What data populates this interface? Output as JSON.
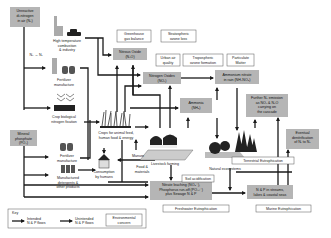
{
  "sources": {
    "unreactive_n2": [
      "Unreactive",
      "di-nitrogen",
      "in air (N₂)"
    ],
    "mineral_phosphate": [
      "Mineral",
      "phosphate",
      "(PO₄)"
    ],
    "n2_to_nr_label": "N₂ → Nᵣ"
  },
  "processes": {
    "combustion": [
      "High temperature",
      "combustion",
      "& industry"
    ],
    "fertilizer_n": [
      "Fertilizer",
      "manufacture"
    ],
    "bnf": [
      "Crop biological",
      "nitrogen fixation"
    ],
    "fertilizer_p": [
      "Fertilizer",
      "manufacture"
    ],
    "detergents": [
      "Manufactured",
      "detergents &",
      "other products"
    ],
    "crops": [
      "Crops for animal feed,",
      "human food & energy"
    ],
    "consumption": [
      "Consumption",
      "by humans"
    ],
    "livestock": "Livestock farming",
    "manure": "Manure",
    "food_materials": [
      "Food &",
      "materials"
    ],
    "natural_ecosystems": "Natural ecosystems"
  },
  "compounds": {
    "nitrous_oxide": [
      "Nitrous Oxide",
      "(N₂O)"
    ],
    "nitrogen_oxides": [
      "Nitrogen Oxides",
      "(NOₓ)"
    ],
    "ammonium_nitrate": [
      "Ammonium nitrate",
      "in rain (NH₄NO₃)"
    ],
    "ammonia": [
      "Ammonia",
      "(NH₃)"
    ],
    "further_emission": [
      "Further N₂ emission",
      "as NOₓ & N₂O",
      "carrying on",
      "the cascade"
    ],
    "denitrification": [
      "Eventual",
      "denitrification",
      "of Nᵣ to N₂"
    ],
    "leaching": [
      "Nitrate leaching (NO₃⁻),",
      "Phosphorus run-off (PO₄³⁻)",
      "plus Sewage N & P"
    ],
    "streams": [
      "N & P in streams,",
      "lakes & coastal seas"
    ]
  },
  "concerns": {
    "greenhouse": [
      "Greenhouse",
      "gas balance"
    ],
    "ozone_loss": [
      "Stratospheric",
      "ozone loss"
    ],
    "urban_air": [
      "Urban air",
      "quality"
    ],
    "tropospheric": [
      "Tropospheric",
      "ozone formation"
    ],
    "particulate": [
      "Particulate",
      "Matter"
    ],
    "terrestrial_eutro": "Terrestrial Eutrophication",
    "soil_acid": "Soil acidification",
    "freshwater_eutro": "Freshwater Eutrophication",
    "marine_eutro": "Marine Eutrophication"
  },
  "key": {
    "title": "Key",
    "intended": [
      "Intended",
      "N & P flows"
    ],
    "unintended": [
      "Unintended",
      "N & P flows"
    ],
    "concern": [
      "Environmental",
      "concern"
    ]
  },
  "colors": {
    "compound_box": "#b5b5b5",
    "arrow": "#1a1a1a",
    "concern_border": "#555555"
  }
}
